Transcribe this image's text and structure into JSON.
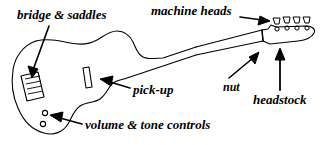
{
  "diagram": {
    "background_color": "#ffffff",
    "stroke_color": "#000000",
    "width": 332,
    "height": 145,
    "labels": [
      {
        "id": "bridge-saddles",
        "text": "bridge & saddles",
        "points_to": "bridge",
        "arrow_direction": "down-left"
      },
      {
        "id": "machine-heads",
        "text": "machine heads",
        "points_to": "tuners",
        "arrow_direction": "right"
      },
      {
        "id": "pick-up",
        "text": "pick-up",
        "points_to": "pickup",
        "arrow_direction": "left"
      },
      {
        "id": "nut",
        "text": "nut",
        "points_to": "nut",
        "arrow_direction": "up-right"
      },
      {
        "id": "headstock",
        "text": "headstock",
        "points_to": "headstock",
        "arrow_direction": "up"
      },
      {
        "id": "volume-tone",
        "text": "volume & tone controls",
        "points_to": "knobs",
        "arrow_direction": "left"
      }
    ],
    "parts": {
      "body": "guitar-body-outline",
      "neck": "guitar-neck",
      "headstock": "guitar-headstock",
      "bridge": "bridge-with-saddles",
      "pickup": "single-pickup-rectangle",
      "knobs": "two-control-knobs",
      "tuners": "four-machine-heads",
      "nut": "nut-line"
    }
  }
}
